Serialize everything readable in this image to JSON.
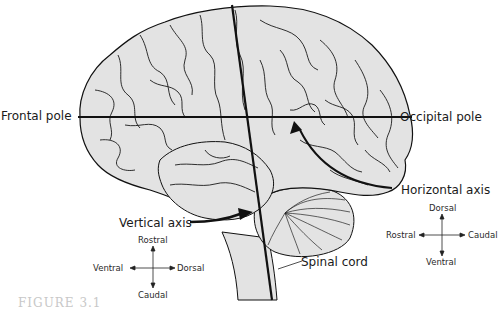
{
  "diagram": {
    "labels": {
      "frontal_pole": "Frontal pole",
      "occipital_pole": "Occipital pole",
      "horizontal_axis": "Horizontal axis",
      "vertical_axis": "Vertical axis",
      "spinal_cord": "Spinal cord"
    },
    "compass_left": {
      "name": "vertical-axis-orientation",
      "top": "Rostral",
      "bottom": "Caudal",
      "left": "Ventral",
      "right": "Dorsal"
    },
    "compass_right": {
      "name": "horizontal-axis-orientation",
      "top": "Dorsal",
      "bottom": "Ventral",
      "left": "Rostral",
      "right": "Caudal"
    },
    "caption": "FIGURE 3.1",
    "colors": {
      "brain_fill": "#e3e3e3",
      "outline": "#111111",
      "axis_line": "#111111",
      "caption": "#c8c8c8"
    }
  }
}
